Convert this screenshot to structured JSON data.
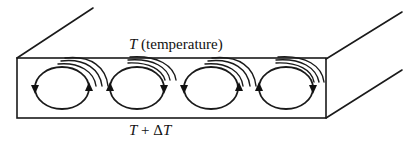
{
  "figure": {
    "top_label": {
      "symbol": "T",
      "text": " (temperature)"
    },
    "bottom_label": {
      "symbol": "T",
      "text": " + Δ",
      "symbol2": "T"
    },
    "cells": [
      {
        "index": 1,
        "rotation": "counterclockwise",
        "arrow_left": "down",
        "arrow_right": "up"
      },
      {
        "index": 2,
        "rotation": "clockwise",
        "arrow_left": "up",
        "arrow_right": "down"
      },
      {
        "index": 3,
        "rotation": "counterclockwise",
        "arrow_left": "down",
        "arrow_right": "up"
      },
      {
        "index": 4,
        "rotation": "clockwise",
        "arrow_left": "up",
        "arrow_right": "down"
      }
    ],
    "colors": {
      "line": "#1a1a1a",
      "background": "#ffffff"
    }
  }
}
